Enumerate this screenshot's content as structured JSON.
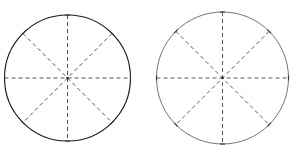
{
  "figure": {
    "title": "Two circles divided into eight equal sectors",
    "background_color": "#ffffff",
    "width": 296,
    "height": 157
  },
  "chart_data": {
    "type": "pie",
    "title": "Two circles divided into eight equal sectors",
    "xlabel": "",
    "ylabel": "",
    "grid": false,
    "legend_position": "none",
    "categories": [
      "1",
      "2",
      "3",
      "4",
      "5",
      "6",
      "7",
      "8"
    ],
    "values": [
      12.5,
      12.5,
      12.5,
      12.5,
      12.5,
      12.5,
      12.5,
      12.5
    ],
    "units": "percent",
    "sector_count": 8,
    "sector_angle_degrees": 45,
    "divider_count": 4,
    "divider_angles_degrees": [
      0,
      45,
      90,
      135
    ],
    "radius_angles_degrees": [
      0,
      45,
      90,
      135,
      180,
      225,
      270,
      315
    ],
    "charts": [
      {
        "name": "left-circle",
        "label": "Circle A",
        "center_x": 67.5,
        "center_y": 78,
        "radius": 63,
        "sectors": 8,
        "outline_color": "#1a1a1a",
        "outline_width": 1.15,
        "divider_color": "#555555",
        "divider_width": 1.0,
        "dash_pattern": "4 3"
      },
      {
        "name": "right-circle",
        "label": "Circle B",
        "center_x": 222.5,
        "center_y": 78,
        "radius": 66,
        "sectors": 8,
        "outline_color": "#6b6b6b",
        "outline_width": 0.95,
        "divider_color": "#5a5a5a",
        "divider_width": 1.0,
        "dash_pattern": "4 3"
      }
    ]
  },
  "style": {
    "tick_length": 5,
    "tick_color": "#333333",
    "tick_width": 1.1,
    "center_dot_color": "#222222",
    "center_dot_radius": 1.2
  }
}
